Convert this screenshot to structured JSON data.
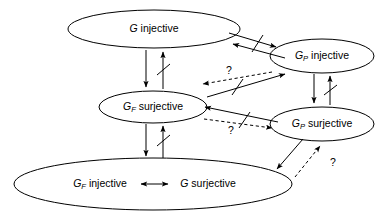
{
  "diagram": {
    "type": "implication-diagram",
    "background_color": "#ffffff",
    "stroke_color": "#000000",
    "nodes": [
      {
        "id": "g-injective",
        "name": "g-injective-node",
        "symbol": "G",
        "subscript": "",
        "property": "injective",
        "text": "G injective",
        "cx": 154,
        "cy": 29,
        "rx": 86,
        "ry": 19
      },
      {
        "id": "gp-injective",
        "name": "gp-injective-node",
        "symbol": "G",
        "subscript": "P",
        "property": "injective",
        "text": "GP injective",
        "cx": 322,
        "cy": 56,
        "rx": 52,
        "ry": 17
      },
      {
        "id": "gf-surjective",
        "name": "gf-surjective-node",
        "symbol": "G",
        "subscript": "F",
        "property": "surjective",
        "text": "GF surjective",
        "cx": 153,
        "cy": 107,
        "rx": 54,
        "ry": 16
      },
      {
        "id": "gp-surjective",
        "name": "gp-surjective-node",
        "symbol": "G",
        "subscript": "P",
        "property": "surjective",
        "text": "GP surjective",
        "cx": 322,
        "cy": 124,
        "rx": 52,
        "ry": 17
      },
      {
        "id": "bottom-equivalence",
        "name": "equivalence-node",
        "left_symbol": "G",
        "left_subscript": "F",
        "left_property": "injective",
        "relation": "⟷",
        "right_symbol": "G",
        "right_subscript": "",
        "right_property": "surjective",
        "text": "GF injective ⟷ G surjective",
        "cx": 153,
        "cy": 184,
        "rx": 139,
        "ry": 26
      }
    ],
    "edges": [
      {
        "id": "e1",
        "name": "edge-g-injective-to-gf-surjective",
        "from": "g-injective",
        "to": "gf-surjective",
        "style": "solid",
        "negated": false,
        "label": ""
      },
      {
        "id": "e2",
        "name": "edge-gf-surjective-to-g-injective-negated",
        "from": "gf-surjective",
        "to": "g-injective",
        "style": "solid",
        "negated": true,
        "label": ""
      },
      {
        "id": "e3",
        "name": "edge-gf-surjective-to-equivalence",
        "from": "gf-surjective",
        "to": "bottom-equivalence",
        "style": "solid",
        "negated": false,
        "label": ""
      },
      {
        "id": "e4",
        "name": "edge-equivalence-to-gf-surjective-negated",
        "from": "bottom-equivalence",
        "to": "gf-surjective",
        "style": "solid",
        "negated": true,
        "label": ""
      },
      {
        "id": "e5",
        "name": "edge-g-injective-to-gp-injective",
        "from": "g-injective",
        "to": "gp-injective",
        "style": "solid",
        "negated": false,
        "label": ""
      },
      {
        "id": "e6",
        "name": "edge-gp-injective-to-g-injective-negated",
        "from": "gp-injective",
        "to": "g-injective",
        "style": "solid",
        "negated": true,
        "label": ""
      },
      {
        "id": "e7",
        "name": "edge-gp-injective-to-gp-surjective",
        "from": "gp-injective",
        "to": "gp-surjective",
        "style": "solid",
        "negated": false,
        "label": ""
      },
      {
        "id": "e8",
        "name": "edge-gp-surjective-to-gp-injective-negated",
        "from": "gp-surjective",
        "to": "gp-injective",
        "style": "solid",
        "negated": true,
        "label": ""
      },
      {
        "id": "e9",
        "name": "edge-gf-surjective-to-gp-injective-negated",
        "from": "gf-surjective",
        "to": "gp-injective",
        "style": "solid",
        "negated": true,
        "label": ""
      },
      {
        "id": "e10",
        "name": "edge-gp-injective-to-gf-surjective-unknown",
        "from": "gp-injective",
        "to": "gf-surjective",
        "style": "dashed",
        "negated": false,
        "label": "?"
      },
      {
        "id": "e11",
        "name": "edge-gp-surjective-to-gf-surjective-negated",
        "from": "gp-surjective",
        "to": "gf-surjective",
        "style": "solid",
        "negated": true,
        "label": ""
      },
      {
        "id": "e12",
        "name": "edge-gf-surjective-to-gp-surjective-unknown",
        "from": "gf-surjective",
        "to": "gp-surjective",
        "style": "dashed",
        "negated": false,
        "label": "?"
      },
      {
        "id": "e13",
        "name": "edge-gp-surjective-to-equivalence",
        "from": "gp-surjective",
        "to": "bottom-equivalence",
        "style": "solid",
        "negated": false,
        "label": ""
      },
      {
        "id": "e14",
        "name": "edge-equivalence-to-gp-surjective-unknown",
        "from": "bottom-equivalence",
        "to": "gp-surjective",
        "style": "dashed",
        "negated": false,
        "label": "?"
      }
    ],
    "question_labels": [
      {
        "id": "q1",
        "name": "question-mark-upper",
        "text": "?",
        "x": 229,
        "y": 71
      },
      {
        "id": "q2",
        "name": "question-mark-middle",
        "text": "?",
        "x": 231,
        "y": 131
      },
      {
        "id": "q3",
        "name": "question-mark-lower",
        "text": "?",
        "x": 333,
        "y": 163
      }
    ]
  }
}
